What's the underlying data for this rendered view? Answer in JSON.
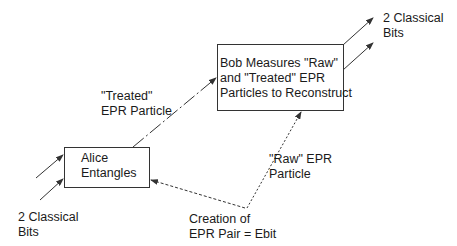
{
  "diagram": {
    "alice_box": {
      "line1": "Alice",
      "line2": "Entangles"
    },
    "bob_box": {
      "line1": "Bob Measures \"Raw\"",
      "line2": "and \"Treated\" EPR",
      "line3": "Particles to Reconstruct"
    },
    "input_bits": {
      "line1": "2 Classical",
      "line2": "Bits"
    },
    "output_bits": {
      "line1": "2 Classical",
      "line2": "Bits"
    },
    "treated_particle": {
      "line1": "\"Treated\"",
      "line2": "EPR Particle"
    },
    "raw_particle": {
      "line1": "\"Raw\" EPR",
      "line2": "Particle"
    },
    "epr_source": {
      "line1": "Creation of",
      "line2": "EPR Pair = Ebit"
    },
    "colors": {
      "line": "#333333",
      "text": "#1a1a1a",
      "background": "#ffffff"
    }
  }
}
